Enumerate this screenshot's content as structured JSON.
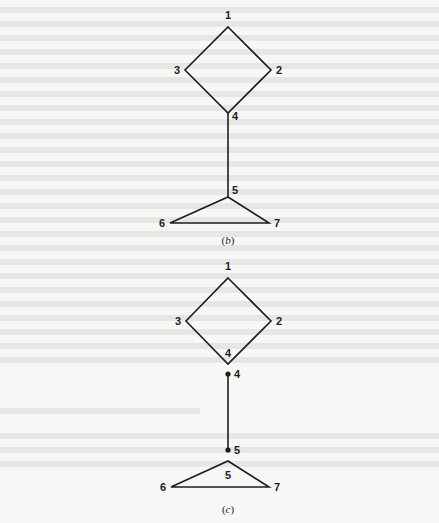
{
  "figure": {
    "panels": [
      {
        "id": "b",
        "caption_open": "(",
        "caption_letter": "b",
        "caption_close": ")",
        "vertices": [
          {
            "label": "1",
            "x": 228,
            "y": 27
          },
          {
            "label": "2",
            "x": 271,
            "y": 70
          },
          {
            "label": "3",
            "x": 185,
            "y": 70
          },
          {
            "label": "4",
            "x": 228,
            "y": 113
          },
          {
            "label": "5",
            "x": 228,
            "y": 197
          },
          {
            "label": "6",
            "x": 170,
            "y": 223
          },
          {
            "label": "7",
            "x": 269,
            "y": 223
          }
        ],
        "edges": [
          [
            "1",
            "2"
          ],
          [
            "1",
            "3"
          ],
          [
            "2",
            "4"
          ],
          [
            "3",
            "4"
          ],
          [
            "4",
            "5"
          ],
          [
            "5",
            "6"
          ],
          [
            "5",
            "7"
          ],
          [
            "6",
            "7"
          ]
        ]
      },
      {
        "id": "c",
        "caption_open": "(",
        "caption_letter": "c",
        "caption_close": ")",
        "vertices": [
          {
            "label": "1",
            "x": 228,
            "y": 278
          },
          {
            "label": "2",
            "x": 271,
            "y": 321
          },
          {
            "label": "3",
            "x": 186,
            "y": 321
          },
          {
            "label": "4",
            "x": 228,
            "y": 364,
            "note": "block vertex label inside diamond"
          },
          {
            "label": "4",
            "x": 228,
            "y": 374,
            "note": "cut vertex dot"
          },
          {
            "label": "5",
            "x": 228,
            "y": 450,
            "note": "cut vertex dot"
          },
          {
            "label": "5",
            "x": 228,
            "y": 461,
            "note": "block vertex label inside triangle"
          },
          {
            "label": "6",
            "x": 171,
            "y": 487
          },
          {
            "label": "7",
            "x": 269,
            "y": 487
          }
        ],
        "edges": [
          [
            "1",
            "2"
          ],
          [
            "1",
            "3"
          ],
          [
            "2",
            "4"
          ],
          [
            "3",
            "4"
          ],
          [
            "4dot",
            "5dot"
          ],
          [
            "5",
            "6"
          ],
          [
            "5",
            "7"
          ],
          [
            "6",
            "7"
          ]
        ]
      }
    ],
    "labels": {
      "b_1": "1",
      "b_2": "2",
      "b_3": "3",
      "b_4": "4",
      "b_5": "5",
      "b_6": "6",
      "b_7": "7",
      "c_1": "1",
      "c_2": "2",
      "c_3": "3",
      "c_4_inner": "4",
      "c_4_dot": "4",
      "c_5_dot": "5",
      "c_5_inner": "5",
      "c_6": "6",
      "c_7": "7"
    }
  },
  "colors": {
    "background": "#f7f7f6",
    "ink": "#1e1e1e",
    "bleed_through": "#e6e6e4"
  }
}
